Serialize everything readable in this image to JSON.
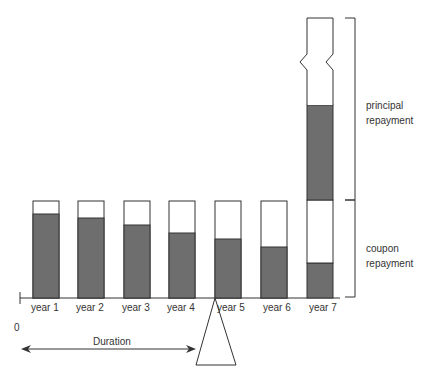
{
  "diagram": {
    "years": [
      {
        "label": "year 1",
        "coupon_share_pct": 87
      },
      {
        "label": "year 2",
        "coupon_share_pct": 82
      },
      {
        "label": "year 3",
        "coupon_share_pct": 75
      },
      {
        "label": "year 4",
        "coupon_share_pct": 67
      },
      {
        "label": "year 5",
        "coupon_share_pct": 61
      },
      {
        "label": "year 6",
        "coupon_share_pct": 53
      },
      {
        "label": "year 7",
        "coupon_share_pct": 35,
        "principal_share_pct": 70,
        "axis_break": true
      }
    ],
    "origin_label": "0",
    "duration_label": "Duration",
    "bracket_labels": {
      "principal": [
        "principal",
        "repayment"
      ],
      "coupon": [
        "coupon",
        "repayment"
      ]
    },
    "colors": {
      "present_value_fill": "#6e6e6e",
      "bar_outline": "#333333",
      "background": "#ffffff"
    }
  }
}
